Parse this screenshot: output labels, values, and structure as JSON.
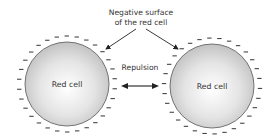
{
  "diagram": {
    "annotation": {
      "line1": "Negative surface",
      "line2": "of the red cell"
    },
    "center_label": "Repulsion",
    "cells": [
      {
        "label": "Red cell"
      },
      {
        "label": "Red cell"
      }
    ],
    "charge_symbol": "−",
    "colors": {
      "cell_fill_center": "#ffffff",
      "cell_fill_edge": "#c4c4c4",
      "cell_outline": "#555555",
      "charge": "#333333",
      "arrow": "#222222"
    }
  }
}
